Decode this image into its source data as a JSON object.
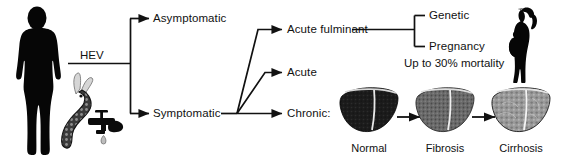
{
  "diagram": {
    "source_label": "HEV",
    "nodes": {
      "asymptomatic": "Asymptomatic",
      "symptomatic": "Symptomatic",
      "acute_fulminant": "Acute fulminant",
      "acute": "Acute",
      "chronic": "Chronic:"
    },
    "risk_factors": {
      "genetic": "Genetic",
      "pregnancy": "Pregnancy",
      "mortality": "Up to 30% mortality"
    },
    "liver_stages": [
      {
        "label": "Normal",
        "shade": "#1b1b1b"
      },
      {
        "label": "Fibrosis",
        "shade": "#6b6b6b"
      },
      {
        "label": "Cirrhosis",
        "shade": "#8e8e8e"
      }
    ],
    "icons": {
      "human": "human-silhouette-icon",
      "pig": "pig-silhouette-icon",
      "tap": "water-tap-icon",
      "waterdrop": "water-drop-icon",
      "pregnant_woman": "pregnant-woman-silhouette-icon"
    },
    "colors": {
      "ink": "#111111",
      "background": "#ffffff",
      "silhouette": "#050505"
    }
  }
}
